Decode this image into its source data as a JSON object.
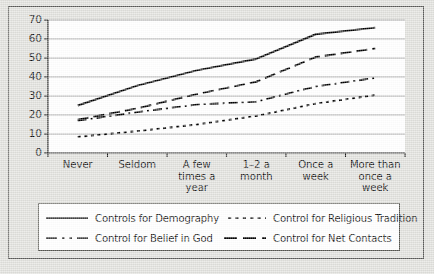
{
  "figure": {
    "background_color": "#dedeta",
    "frame_color": "#5a5a58",
    "plot_background": "#ffffff"
  },
  "chart_data": {
    "type": "line",
    "title": "",
    "xlabel": "",
    "ylabel": "",
    "ylim": [
      0,
      70
    ],
    "yticks": [
      0,
      10,
      20,
      30,
      40,
      50,
      60,
      70
    ],
    "grid": true,
    "grid_axis": "y",
    "legend_position": "bottom",
    "categories": [
      "Never",
      "Seldom",
      "A few times a year",
      "1–2 a month",
      "Once a week",
      "More than once a week"
    ],
    "series": [
      {
        "name": "Controls for Demography",
        "style": "solid",
        "values": [
          25,
          35.5,
          43.5,
          49.5,
          62.5,
          66
        ]
      },
      {
        "name": "Control for Net Contacts",
        "style": "long-dash",
        "values": [
          17.5,
          23.5,
          31,
          37.5,
          50.5,
          55
        ]
      },
      {
        "name": "Control for Belief in God",
        "style": "dash-dot",
        "values": [
          17,
          21.5,
          25.5,
          27,
          35,
          39.5
        ]
      },
      {
        "name": "Control for Religious Tradition",
        "style": "dotted",
        "values": [
          8.5,
          11.5,
          15,
          19.5,
          26,
          30.5
        ]
      }
    ]
  },
  "axis": {
    "y_tick_labels": [
      "70",
      "60",
      "50",
      "40",
      "30",
      "20",
      "10",
      "0"
    ],
    "x_tick_labels": [
      "Never",
      "Seldom",
      "A few\ntimes a\nyear",
      "1–2 a\nmonth",
      "Once a\nweek",
      "More than\nonce a\nweek"
    ]
  },
  "legend": {
    "entries": [
      {
        "label": "Controls for Demography",
        "style": "solid"
      },
      {
        "label": "Control for Religious Tradition",
        "style": "dotted"
      },
      {
        "label": "Control for Belief in God",
        "style": "dash-dot"
      },
      {
        "label": "Control for Net Contacts",
        "style": "long-dash"
      }
    ]
  }
}
